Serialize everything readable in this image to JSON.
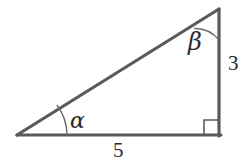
{
  "figure": {
    "type": "right-triangle-diagram",
    "background_color": "#ffffff",
    "stroke_color": "#5a5a5a",
    "text_color": "#2b2b2b",
    "labels": {
      "angle_alpha": "α",
      "angle_beta": "β",
      "side_vertical": "3",
      "side_horizontal": "5"
    },
    "markers": {
      "right_angle": "right-angle-square",
      "alpha_arc": "angle-arc",
      "beta_arc": "angle-arc"
    },
    "geometry": {
      "vertex_left": [
        17,
        135
      ],
      "vertex_bottom_right": [
        220,
        135
      ],
      "vertex_top_right": [
        219,
        9
      ],
      "alpha_arc_radius": 50,
      "beta_arc_radius": 31,
      "right_angle_box_size": 15,
      "stroke_width": 3
    }
  }
}
